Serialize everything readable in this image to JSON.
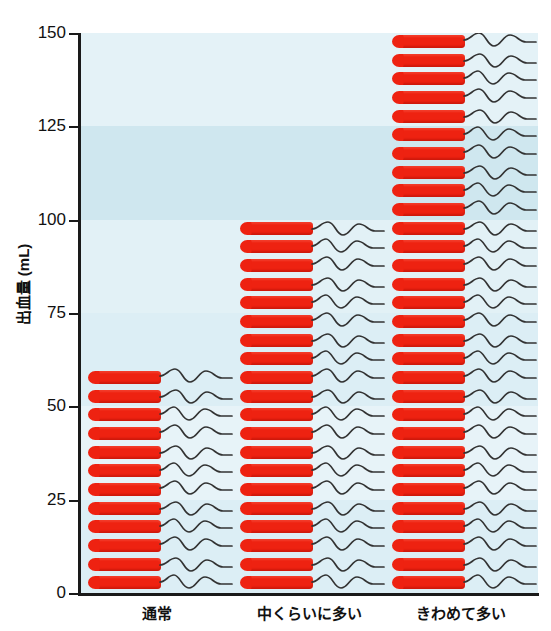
{
  "chart_data": {
    "type": "bar",
    "title": "",
    "subtitle": "",
    "xlabel": "",
    "ylabel": "出血量 (mL)",
    "categories": [
      "通常",
      "中くらいに多い",
      "きわめて多い"
    ],
    "values": [
      57,
      100,
      150
    ],
    "units": [
      12,
      20,
      30
    ],
    "unit_value_mL": 5,
    "pictogram": "tampon-icon",
    "ylim": [
      0,
      150
    ],
    "yticks": [
      0,
      25,
      50,
      75,
      100,
      125,
      150
    ],
    "ytick_labels": [
      "0",
      "25",
      "50",
      "75",
      "100",
      "125",
      "150"
    ],
    "grid": false,
    "legend": null,
    "bands": [
      {
        "from": 0,
        "to": 25,
        "color": "#dceef5"
      },
      {
        "from": 25,
        "to": 50,
        "color": "#e7f3f8"
      },
      {
        "from": 50,
        "to": 75,
        "color": "#dceef5"
      },
      {
        "from": 75,
        "to": 100,
        "color": "#e2f1f6"
      },
      {
        "from": 100,
        "to": 125,
        "color": "#cfe7ef"
      },
      {
        "from": 125,
        "to": 150,
        "color": "#e4f2f7"
      }
    ],
    "colors": {
      "pictogram": "#ee2211",
      "string": "#333333",
      "axis": "#1a1a1a",
      "plot_background": "#e7f3f8",
      "text": "#111111"
    }
  },
  "axis": {
    "y_label": "出血量 (mL)",
    "y_ticks": [
      "150",
      "125",
      "100",
      "75",
      "50",
      "25",
      "0"
    ]
  },
  "x_categories": {
    "normal": "通常",
    "moderate": "中くらいに多い",
    "extreme": "きわめて多い"
  },
  "icons": {
    "tampon": "tampon-icon",
    "string": "wavy-string-icon"
  }
}
